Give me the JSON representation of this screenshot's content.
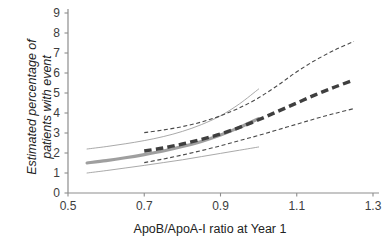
{
  "chart_data": {
    "type": "line",
    "title": "",
    "xlabel": "ApoB/ApoA-I ratio at Year 1",
    "ylabel_line1": "Estimated percentage of",
    "ylabel_line2": "patients with event",
    "ylabel": "Estimated percentage of patients with event",
    "xlim": [
      0.5,
      1.3
    ],
    "ylim": [
      0,
      9
    ],
    "xticks": [
      "0.5",
      "0.7",
      "0.9",
      "1.1",
      "1.3"
    ],
    "xtick_values": [
      0.5,
      0.7,
      0.9,
      1.1,
      1.3
    ],
    "yticks": [
      "0",
      "1",
      "2",
      "3",
      "4",
      "5",
      "6",
      "7",
      "8",
      "9"
    ],
    "ytick_values": [
      0,
      1,
      2,
      3,
      4,
      5,
      6,
      7,
      8,
      9
    ],
    "grid": false,
    "legend": "none",
    "colors": {
      "solid_series": "#9a9a9a",
      "dashed_series": "#3f3f3f",
      "axis": "#8d8d8d",
      "text": "#333333"
    },
    "series": [
      {
        "name": "Solid estimate (thick grey)",
        "style": "solid-thick",
        "color": "#9a9a9a",
        "x": [
          0.55,
          0.6,
          0.65,
          0.7,
          0.75,
          0.8,
          0.85,
          0.9,
          0.95,
          1.0
        ],
        "values": [
          1.5,
          1.62,
          1.76,
          1.92,
          2.1,
          2.32,
          2.58,
          2.9,
          3.28,
          3.72
        ]
      },
      {
        "name": "Solid upper 95% CI (thin grey)",
        "style": "solid-thin",
        "color": "#9a9a9a",
        "x": [
          0.55,
          0.6,
          0.65,
          0.7,
          0.75,
          0.8,
          0.85,
          0.9,
          0.95,
          1.0
        ],
        "values": [
          2.2,
          2.32,
          2.46,
          2.62,
          2.82,
          3.08,
          3.42,
          3.86,
          4.46,
          5.2
        ]
      },
      {
        "name": "Solid lower 95% CI (thin grey)",
        "style": "solid-thin",
        "color": "#9a9a9a",
        "x": [
          0.55,
          0.6,
          0.65,
          0.7,
          0.75,
          0.8,
          0.85,
          0.9,
          0.95,
          1.0
        ],
        "values": [
          1.0,
          1.12,
          1.25,
          1.38,
          1.52,
          1.66,
          1.82,
          1.98,
          2.14,
          2.3
        ]
      },
      {
        "name": "Dashed estimate (thick dark)",
        "style": "dashed-thick",
        "color": "#3f3f3f",
        "x": [
          0.7,
          0.75,
          0.8,
          0.85,
          0.9,
          0.95,
          1.0,
          1.05,
          1.1,
          1.15,
          1.2,
          1.25
        ],
        "values": [
          2.1,
          2.25,
          2.45,
          2.68,
          2.95,
          3.28,
          3.66,
          4.08,
          4.5,
          4.92,
          5.3,
          5.65
        ]
      },
      {
        "name": "Dashed upper 95% CI (thin dark)",
        "style": "dashed-thin",
        "color": "#3f3f3f",
        "x": [
          0.7,
          0.75,
          0.8,
          0.85,
          0.9,
          0.95,
          1.0,
          1.05,
          1.1,
          1.15,
          1.2,
          1.25
        ],
        "values": [
          3.02,
          3.15,
          3.32,
          3.55,
          3.86,
          4.26,
          4.76,
          5.38,
          6.06,
          6.65,
          7.15,
          7.58
        ]
      },
      {
        "name": "Dashed lower 95% CI (thin dark)",
        "style": "dashed-thin",
        "color": "#3f3f3f",
        "x": [
          0.7,
          0.75,
          0.8,
          0.85,
          0.9,
          0.95,
          1.0,
          1.05,
          1.1,
          1.15,
          1.2,
          1.25
        ],
        "values": [
          1.52,
          1.7,
          1.9,
          2.12,
          2.36,
          2.62,
          2.88,
          3.16,
          3.44,
          3.72,
          3.98,
          4.22
        ]
      }
    ]
  }
}
